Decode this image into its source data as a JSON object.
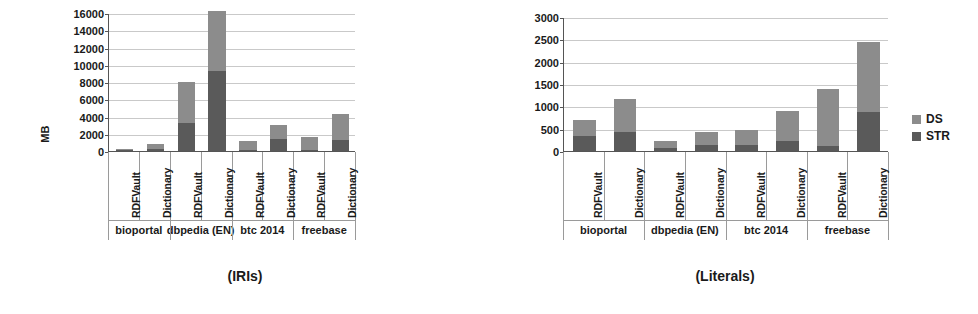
{
  "figure": {
    "ylabel": "MB",
    "legend": {
      "position": "right",
      "items": [
        {
          "label": "DS",
          "color": "#8c8c8c"
        },
        {
          "label": "STR",
          "color": "#5a5a5a"
        }
      ]
    }
  },
  "chart_data": [
    {
      "type": "bar",
      "stacked": true,
      "title": "(IRIs)",
      "xlabel": "",
      "ylabel": "MB",
      "ylim": [
        0,
        16000
      ],
      "ytick_step": 2000,
      "yticks": [
        0,
        2000,
        4000,
        6000,
        8000,
        10000,
        12000,
        14000,
        16000
      ],
      "grid": true,
      "groups": [
        "bioportal",
        "dbpedia (EN)",
        "btc 2014",
        "freebase"
      ],
      "categories": [
        "RDFVault",
        "Dictionary",
        "RDFVault",
        "Dictionary",
        "RDFVault",
        "Dictionary",
        "RDFVault",
        "Dictionary"
      ],
      "series": [
        {
          "name": "STR",
          "color": "#5a5a5a",
          "values": [
            130,
            180,
            3300,
            9300,
            150,
            1400,
            170,
            1250
          ]
        },
        {
          "name": "DS",
          "color": "#8c8c8c",
          "values": [
            50,
            620,
            4650,
            6900,
            1050,
            1600,
            1430,
            3050
          ]
        }
      ],
      "totals": [
        180,
        800,
        7950,
        16200,
        1200,
        3000,
        1600,
        4300
      ]
    },
    {
      "type": "bar",
      "stacked": true,
      "title": "(Literals)",
      "xlabel": "",
      "ylabel": "",
      "ylim": [
        0,
        3000
      ],
      "ytick_step": 500,
      "yticks": [
        0,
        500,
        1000,
        1500,
        2000,
        2500,
        3000
      ],
      "grid": true,
      "groups": [
        "bioportal",
        "dbpedia (EN)",
        "btc 2014",
        "freebase"
      ],
      "categories": [
        "RDFVault",
        "Dictionary",
        "RDFVault",
        "Dictionary",
        "RDFVault",
        "Dictionary",
        "RDFVault",
        "Dictionary"
      ],
      "series": [
        {
          "name": "STR",
          "color": "#5a5a5a",
          "values": [
            330,
            420,
            60,
            140,
            130,
            230,
            120,
            880
          ]
        },
        {
          "name": "DS",
          "color": "#8c8c8c",
          "values": [
            370,
            740,
            170,
            290,
            340,
            670,
            1260,
            1550
          ]
        }
      ],
      "totals": [
        700,
        1160,
        230,
        430,
        470,
        900,
        1380,
        2430
      ]
    }
  ]
}
